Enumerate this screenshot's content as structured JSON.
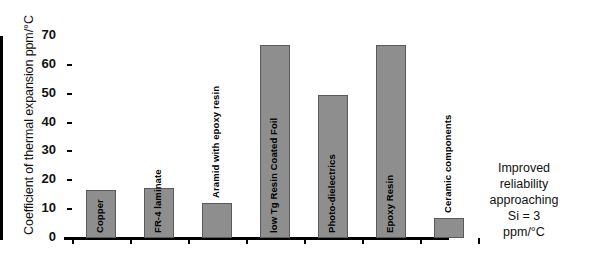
{
  "chart_data": {
    "type": "bar",
    "title": "",
    "xlabel": "",
    "ylabel": "Coefficient of thermal expansion ppm/°C",
    "ylim": [
      0,
      70
    ],
    "yticks": [
      0,
      10,
      20,
      30,
      40,
      50,
      60,
      70
    ],
    "grid": false,
    "legend": "none",
    "bar_color": "#8e8e8e",
    "categories": [
      "Copper",
      "FR-4 laminate",
      "Aramid with epoxy resin",
      "low Tg Resin Coated Foil",
      "Photo-dielectrics",
      "Epoxy Resin",
      "Ceramic components"
    ],
    "values": [
      16.5,
      17.5,
      12,
      67,
      49.5,
      67,
      7
    ],
    "annotations": [
      "Improved",
      "reliability",
      "approaching",
      "Si = 3",
      "ppm/°C"
    ]
  },
  "axis": {
    "ytick_labels": [
      "70",
      "60",
      "50",
      "40",
      "30",
      "20",
      "10",
      "0"
    ]
  },
  "bars": [
    {
      "label": "Copper",
      "value": 16.5,
      "label_inside": true,
      "x": 20,
      "w": 30
    },
    {
      "label": "FR-4 laminate",
      "value": 17.5,
      "label_inside": true,
      "x": 78,
      "w": 30
    },
    {
      "label": "Aramid with epoxy resin",
      "value": 12,
      "label_inside": false,
      "x": 136,
      "w": 30
    },
    {
      "label": "low Tg Resin Coated Foil",
      "value": 67,
      "label_inside": true,
      "x": 194,
      "w": 30
    },
    {
      "label": "Photo-dielectrics",
      "value": 49.5,
      "label_inside": true,
      "x": 252,
      "w": 30
    },
    {
      "label": "Epoxy Resin",
      "value": 67,
      "label_inside": true,
      "x": 310,
      "w": 30
    },
    {
      "label": "Ceramic components",
      "value": 7,
      "label_inside": false,
      "x": 368,
      "w": 30
    }
  ],
  "annotation": {
    "line1": "Improved",
    "line2": "reliability",
    "line3": "approaching",
    "line4": "Si = 3",
    "line5": "ppm/°C"
  }
}
